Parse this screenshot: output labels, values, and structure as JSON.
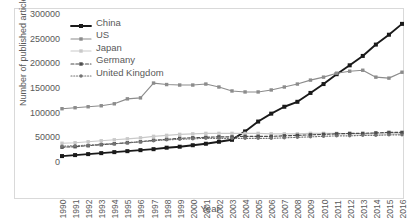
{
  "chart_data": {
    "type": "line",
    "title": "",
    "xlabel": "Year",
    "ylabel": "Number of published articles",
    "x": [
      1990,
      1991,
      1992,
      1993,
      1994,
      1995,
      1996,
      1997,
      1998,
      1999,
      2000,
      2001,
      2002,
      2003,
      2004,
      2005,
      2006,
      2007,
      2008,
      2009,
      2010,
      2011,
      2012,
      2013,
      2014,
      2015,
      2016
    ],
    "xtick_labels": [
      "1990",
      "1991",
      "1992",
      "1993",
      "1994",
      "1995",
      "1996",
      "1997",
      "1998",
      "1999",
      "2000",
      "2001",
      "2002",
      "2003",
      "2004",
      "2005",
      "2006",
      "2007",
      "2008",
      "2009",
      "2010",
      "2011",
      "2012",
      "2013",
      "2014",
      "2015",
      "2016"
    ],
    "ylim": [
      0,
      300000
    ],
    "xlim": [
      1990,
      2016
    ],
    "ytick_labels": [
      "0",
      "50000",
      "100000",
      "150000",
      "200000",
      "250000",
      "300000"
    ],
    "yticks": [
      0,
      50000,
      100000,
      150000,
      200000,
      250000,
      300000
    ],
    "grid": false,
    "legend_position": "upper left",
    "series": [
      {
        "name": "China",
        "color": "#1a1a1a",
        "linestyle": "solid",
        "marker": "square",
        "values": [
          12000,
          14000,
          16000,
          18000,
          20000,
          22000,
          24000,
          26000,
          29000,
          31000,
          34000,
          37000,
          41000,
          45000,
          62000,
          82000,
          98000,
          112000,
          122000,
          140000,
          158000,
          178000,
          196000,
          215000,
          238000,
          258000,
          280000
        ]
      },
      {
        "name": "US",
        "color": "#8c8c8c",
        "linestyle": "solid",
        "marker": "square",
        "values": [
          108000,
          110000,
          112000,
          114000,
          118000,
          128000,
          130000,
          160000,
          157000,
          156000,
          156000,
          158000,
          152000,
          144000,
          142000,
          142000,
          146000,
          152000,
          158000,
          166000,
          172000,
          180000,
          184000,
          186000,
          172000,
          170000,
          182000
        ]
      },
      {
        "name": "Japan",
        "color": "#c9c9c9",
        "linestyle": "solid",
        "marker": "square",
        "values": [
          38000,
          39000,
          41000,
          43000,
          45000,
          47000,
          49000,
          52000,
          54000,
          56000,
          57000,
          58000,
          58000,
          58000,
          58000,
          58000,
          57000,
          57000,
          57000,
          58000,
          58000,
          58000,
          57000,
          57000,
          57000,
          57000,
          57000
        ]
      },
      {
        "name": "Germany",
        "color": "#4d4d4d",
        "linestyle": "dashed",
        "marker": "square",
        "values": [
          30000,
          31000,
          33000,
          35000,
          37000,
          39000,
          41000,
          44000,
          46000,
          48000,
          49000,
          50000,
          51000,
          51000,
          52000,
          52000,
          52000,
          53000,
          54000,
          55000,
          56000,
          57000,
          58000,
          58000,
          59000,
          60000,
          60000
        ]
      },
      {
        "name": "United Kingdom",
        "color": "#737373",
        "linestyle": "dotted",
        "marker": "circle",
        "values": [
          32000,
          33000,
          34000,
          36000,
          37000,
          39000,
          41000,
          43000,
          45000,
          46000,
          47000,
          48000,
          48000,
          48000,
          48000,
          48000,
          48000,
          49000,
          50000,
          51000,
          52000,
          53000,
          53000,
          54000,
          54000,
          55000,
          55000
        ]
      }
    ]
  }
}
